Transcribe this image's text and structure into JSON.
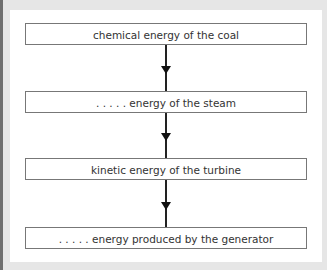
{
  "diagram": {
    "type": "flow",
    "boxes": [
      {
        "label": "chemical energy of the coal"
      },
      {
        "label": ". . . . . energy of the steam"
      },
      {
        "label": "kinetic energy of the turbine"
      },
      {
        "label": ". . . . . energy produced by the generator"
      }
    ],
    "arrows": [
      {
        "from": 0,
        "to": 1
      },
      {
        "from": 1,
        "to": 2
      },
      {
        "from": 2,
        "to": 3
      }
    ]
  }
}
